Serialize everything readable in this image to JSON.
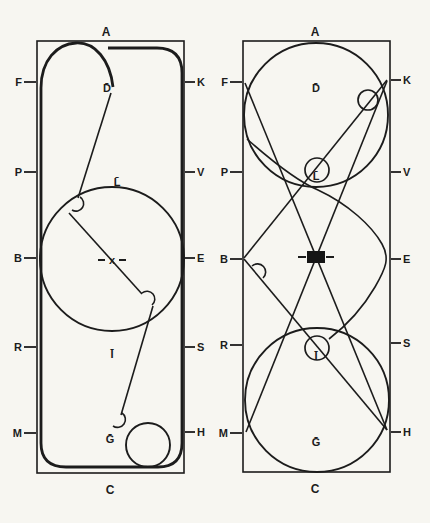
{
  "colors": {
    "ink": "#1c1c1c",
    "paper": "#f7f6f1"
  },
  "panels": {
    "left": {
      "top": "A",
      "bottom": "C",
      "left_edge": [
        "F",
        "P",
        "B",
        "R",
        "M"
      ],
      "right_edge": [
        "K",
        "V",
        "E",
        "S",
        "H"
      ],
      "marks": {
        "d": "D̄",
        "l": "L̄",
        "x": "x",
        "i": "Ī",
        "g": "Ḡ"
      }
    },
    "right": {
      "top": "A",
      "bottom": "C",
      "left_edge": [
        "F",
        "P",
        "B",
        "R",
        "M"
      ],
      "right_edge": [
        "K",
        "V",
        "E",
        "S",
        "H"
      ],
      "marks": {
        "d": "D̄",
        "l": "L̄",
        "i": "Ī",
        "g": "Ḡ"
      }
    }
  }
}
